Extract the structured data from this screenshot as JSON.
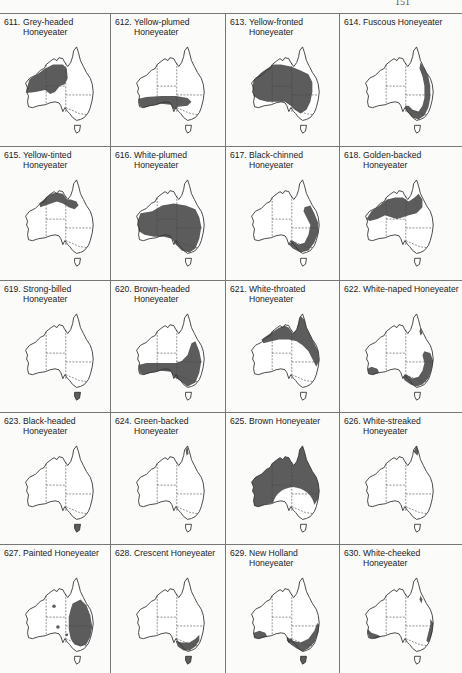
{
  "page": {
    "number": "151"
  },
  "panels": [
    {
      "num": "611.",
      "name": "Grey-headed Honeyeater"
    },
    {
      "num": "612.",
      "name": "Yellow-plumed Honeyeater"
    },
    {
      "num": "613.",
      "name": "Yellow-fronted Honeyeater"
    },
    {
      "num": "614.",
      "name": "Fuscous Honeyeater"
    },
    {
      "num": "615.",
      "name": "Yellow-tinted Honeyeater"
    },
    {
      "num": "616.",
      "name": "White-plumed Honeyeater"
    },
    {
      "num": "617.",
      "name": "Black-chinned Honeyeater"
    },
    {
      "num": "618.",
      "name": "Golden-backed Honeyeater"
    },
    {
      "num": "619.",
      "name": "Strong-billed Honeyeater"
    },
    {
      "num": "620.",
      "name": "Brown-headed Honeyeater"
    },
    {
      "num": "621.",
      "name": "White-throated Honeyeater"
    },
    {
      "num": "622.",
      "name": "White-naped Honeyeater"
    },
    {
      "num": "623.",
      "name": "Black-headed Honeyeater"
    },
    {
      "num": "624.",
      "name": "Green-backed Honeyeater"
    },
    {
      "num": "625.",
      "name": "Brown Honeyeater"
    },
    {
      "num": "626.",
      "name": "White-streaked Honeyeater"
    },
    {
      "num": "627.",
      "name": "Painted Honeyeater"
    },
    {
      "num": "628.",
      "name": "Crescent Honeyeater"
    },
    {
      "num": "629.",
      "name": "New Holland Honeyeater"
    },
    {
      "num": "630.",
      "name": "White-cheeked Honeyeater"
    }
  ],
  "colors": {
    "distribution": "#5c5c5c",
    "outline": "#333333",
    "rule": "#777777"
  }
}
